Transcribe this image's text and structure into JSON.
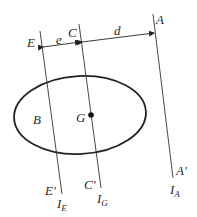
{
  "diagram": {
    "type": "parallel-axis-theorem",
    "labels": {
      "E": "E",
      "C": "C",
      "A": "A",
      "e": "e",
      "d": "d",
      "B": "B",
      "G": "G",
      "E_prime": "E'",
      "C_prime": "C'",
      "A_prime": "A'",
      "I_E": "I",
      "I_E_sub": "E",
      "I_G": "I",
      "I_G_sub": "G",
      "I_A": "I",
      "I_A_sub": "A"
    },
    "colors": {
      "stroke": "#222222",
      "text": "#2a2a2a",
      "background": "#ffffff"
    }
  }
}
